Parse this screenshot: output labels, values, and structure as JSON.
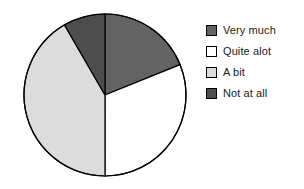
{
  "chart_data": {
    "type": "pie",
    "title": "",
    "subtitle": "",
    "legend_position": "right",
    "grid": false,
    "start_angle_deg": 0,
    "direction": "clockwise",
    "categories": [
      "Very much",
      "Quite alot",
      "A bit",
      "Not at all"
    ],
    "values": [
      19,
      31,
      42,
      8
    ],
    "value_unit": "percent",
    "slices": [
      {
        "label": "Very much",
        "value": 19,
        "start_angle_deg": 0,
        "end_angle_deg": 68,
        "color": "#636363",
        "edge_color": "#000000"
      },
      {
        "label": "Quite alot",
        "value": 31,
        "start_angle_deg": 68,
        "end_angle_deg": 180,
        "color": "#ffffff",
        "edge_color": "#000000"
      },
      {
        "label": "A bit",
        "value": 42,
        "start_angle_deg": 180,
        "end_angle_deg": 330,
        "color": "#dcdcdc",
        "edge_color": "#000000"
      },
      {
        "label": "Not at all",
        "value": 8,
        "start_angle_deg": 330,
        "end_angle_deg": 360,
        "color": "#4d4d4d",
        "edge_color": "#000000"
      }
    ]
  },
  "legend": {
    "items": [
      {
        "label": "Very much",
        "color": "#636363"
      },
      {
        "label": "Quite alot",
        "color": "#ffffff"
      },
      {
        "label": "A bit",
        "color": "#dcdcdc"
      },
      {
        "label": "Not at all",
        "color": "#4d4d4d"
      }
    ]
  },
  "geometry": {
    "center_x": 105,
    "center_y": 95,
    "radius": 81
  },
  "colors": {
    "background": "#ffffff",
    "outline": "#000000",
    "text": "#1a1a1a"
  }
}
